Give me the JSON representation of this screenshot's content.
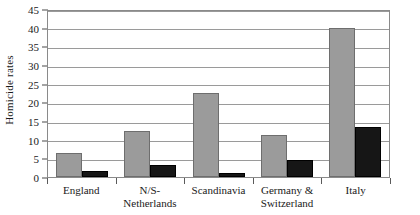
{
  "chart_data": {
    "type": "bar",
    "title": "",
    "subtitle": "",
    "xlabel": "",
    "ylabel": "Homicide rates",
    "ylim": [
      0,
      45
    ],
    "y_ticks": [
      0,
      5,
      10,
      15,
      20,
      25,
      30,
      35,
      40,
      45
    ],
    "grid": true,
    "legend": "none",
    "categories": [
      "England",
      "N/S-Netherlands",
      "Scandinavia",
      "Germany & Switzerland",
      "Italy"
    ],
    "category_lines": [
      [
        "England"
      ],
      [
        "N/S-",
        "Netherlands"
      ],
      [
        "Scandinavia"
      ],
      [
        "Germany &",
        "Switzerland"
      ],
      [
        "Italy"
      ]
    ],
    "series": [
      {
        "name": "gray",
        "color": "#9b9b9b",
        "values": [
          6.5,
          12.2,
          22.5,
          11.2,
          40.0
        ]
      },
      {
        "name": "black",
        "color": "#161616",
        "values": [
          1.6,
          3.1,
          1.0,
          4.6,
          13.5
        ]
      }
    ]
  },
  "axis": {
    "y_title": "Homicide rates",
    "tick_labels": [
      "45",
      "40",
      "35",
      "30",
      "25",
      "20",
      "15",
      "10",
      "5",
      "0"
    ]
  },
  "colors": {
    "series_gray": "#9b9b9b",
    "series_black": "#161616",
    "gridline": "#9a9a9a",
    "frame": "#8a8a8a",
    "axis": "#4a4a4a",
    "background": "#ffffff",
    "text": "#1a1a1a"
  }
}
